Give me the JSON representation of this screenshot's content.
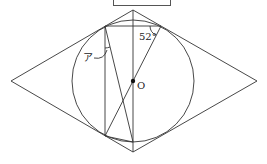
{
  "diagram": {
    "type": "geometry",
    "answer_box": "",
    "labels": {
      "angle_given": "52°",
      "angle_unknown": "ア",
      "center": "O"
    },
    "points": {
      "rhombus_left": [
        11,
        81
      ],
      "rhombus_top": [
        133,
        10
      ],
      "rhombus_right": [
        257,
        81
      ],
      "rhombus_bottom": [
        133,
        152
      ],
      "center_O": [
        133,
        81
      ],
      "tangent_upper_left": [
        105,
        26
      ],
      "tangent_upper_right": [
        161,
        26
      ],
      "tangent_lower_left": [
        105,
        136
      ],
      "circle_bottom": [
        133,
        142
      ]
    },
    "circle": {
      "cx": 133,
      "cy": 81,
      "r": 61
    },
    "colors": {
      "stroke": "#333333",
      "background": "#ffffff"
    }
  }
}
